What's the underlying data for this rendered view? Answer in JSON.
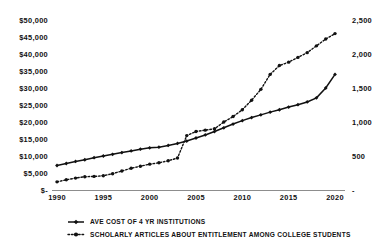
{
  "chart_data": {
    "type": "line",
    "title": "",
    "subtitle": "",
    "xlabel": "",
    "ylabel": "",
    "grid": false,
    "legend_position": "bottom",
    "x": [
      1990,
      1991,
      1992,
      1993,
      1994,
      1995,
      1996,
      1997,
      1998,
      1999,
      2000,
      2001,
      2002,
      2003,
      2004,
      2005,
      2006,
      2007,
      2008,
      2009,
      2010,
      2011,
      2012,
      2013,
      2014,
      2015,
      2016,
      2017,
      2018,
      2019,
      2020
    ],
    "xlim": [
      1990,
      2020
    ],
    "xticks": [
      "1990",
      "1995",
      "2000",
      "2005",
      "2010",
      "2015",
      "2020"
    ],
    "xtick_values": [
      1990,
      1995,
      2000,
      2005,
      2010,
      2015,
      2020
    ],
    "axes": {
      "left": {
        "ylim": [
          0,
          50000
        ],
        "ticks": [
          "$-",
          "$5,000",
          "$10,000",
          "$15,000",
          "$20,000",
          "$25,000",
          "$30,000",
          "$35,000",
          "$40,000",
          "$45,000",
          "$50,000"
        ],
        "tick_values": [
          0,
          5000,
          10000,
          15000,
          20000,
          25000,
          30000,
          35000,
          40000,
          45000,
          50000
        ]
      },
      "right": {
        "ylim": [
          0,
          2500
        ],
        "ticks": [
          "-",
          "500",
          "1,000",
          "1,500",
          "2,000",
          "2,500"
        ],
        "tick_values": [
          0,
          500,
          1000,
          1500,
          2000,
          2500
        ]
      }
    },
    "series": [
      {
        "name": "AVE COST OF 4 YR INSTITUTIONS",
        "axis": "left",
        "style": "solid",
        "marker": "diamond",
        "color": "#111111",
        "values": [
          7200,
          7800,
          8400,
          8900,
          9500,
          10000,
          10500,
          11000,
          11500,
          12000,
          12400,
          12600,
          13100,
          13700,
          14400,
          15300,
          16200,
          17200,
          18300,
          19400,
          20400,
          21300,
          22100,
          22900,
          23600,
          24400,
          25100,
          25900,
          27100,
          30000,
          34000
        ]
      },
      {
        "name": "SCHOLARLY ARTICLES ABOUT ENTITLEMENT AMONG COLLEGE STUDENTS",
        "axis": "right",
        "style": "dotted",
        "marker": "circle",
        "color": "#111111",
        "values": [
          120,
          150,
          175,
          195,
          200,
          210,
          240,
          280,
          320,
          350,
          380,
          400,
          430,
          470,
          800,
          860,
          880,
          900,
          1000,
          1080,
          1180,
          1320,
          1480,
          1700,
          1830,
          1880,
          1950,
          2020,
          2120,
          2220,
          2300
        ]
      }
    ],
    "annotations": []
  },
  "legend": {
    "entries": [
      {
        "label": "AVE COST OF 4 YR INSTITUTIONS",
        "marker": "diamond-marker",
        "style": "solid"
      },
      {
        "label": "SCHOLARLY ARTICLES ABOUT ENTITLEMENT AMONG COLLEGE STUDENTS",
        "marker": "dot-marker",
        "style": "dotted"
      }
    ]
  }
}
